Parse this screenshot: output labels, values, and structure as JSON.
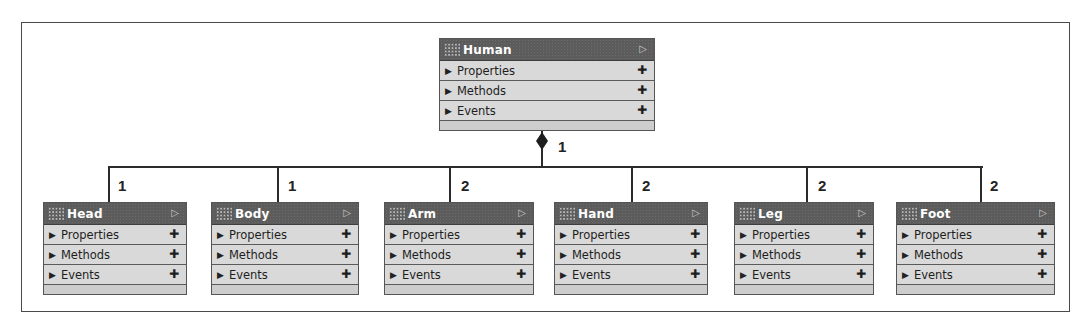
{
  "diagram": {
    "parent": {
      "name": "Human",
      "sections": [
        "Properties",
        "Methods",
        "Events"
      ],
      "multiplicity": "1"
    },
    "children": [
      {
        "name": "Head",
        "sections": [
          "Properties",
          "Methods",
          "Events"
        ],
        "multiplicity": "1"
      },
      {
        "name": "Body",
        "sections": [
          "Properties",
          "Methods",
          "Events"
        ],
        "multiplicity": "1"
      },
      {
        "name": "Arm",
        "sections": [
          "Properties",
          "Methods",
          "Events"
        ],
        "multiplicity": "2"
      },
      {
        "name": "Hand",
        "sections": [
          "Properties",
          "Methods",
          "Events"
        ],
        "multiplicity": "2"
      },
      {
        "name": "Leg",
        "sections": [
          "Properties",
          "Methods",
          "Events"
        ],
        "multiplicity": "2"
      },
      {
        "name": "Foot",
        "sections": [
          "Properties",
          "Methods",
          "Events"
        ],
        "multiplicity": "2"
      }
    ],
    "relationship": "composition"
  },
  "icons": {
    "expand": "▶",
    "add": "✚",
    "collapse": "▷"
  },
  "colors": {
    "header": "#5c5c5c",
    "row": "#d9d9d9",
    "line": "#2b2b2b"
  }
}
